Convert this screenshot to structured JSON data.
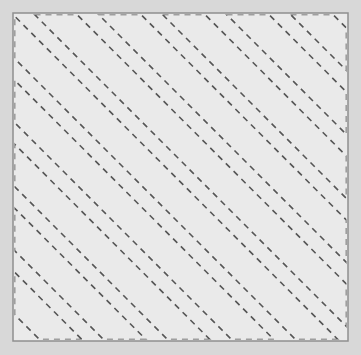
{
  "figure": {
    "canvas": {
      "width": 361,
      "height": 355,
      "background_color": "#d8d8d8"
    },
    "panel": {
      "name": "hatched-square",
      "x": 13,
      "y": 13,
      "width": 335,
      "height": 328,
      "fill_color": "#eaeaea",
      "border_color": "#8f8f8f",
      "border_width": 1.5
    },
    "pattern": {
      "type": "diagonal-band-hatch",
      "stroke_color": "#555555",
      "stroke_width": 1.6,
      "dash_length": 6,
      "dash_gap": 5,
      "angle_degrees": 45,
      "direction": "up-right",
      "band_width": 30,
      "band_period": 64,
      "band_count": 11,
      "first_band_offset": -300,
      "edge_caps": {
        "top_caps": 5,
        "bottom_caps": 5,
        "left_caps": 5,
        "right_caps": 5
      }
    }
  }
}
